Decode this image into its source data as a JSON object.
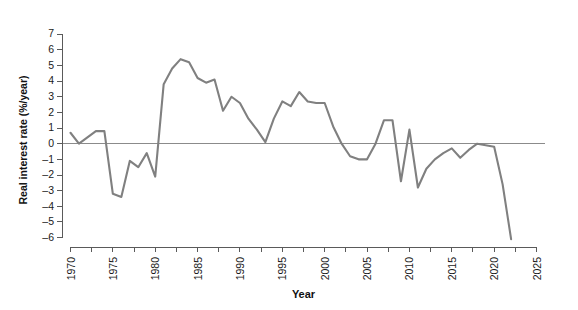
{
  "chart_data": {
    "type": "line",
    "title": "",
    "xlabel": "Year",
    "ylabel": "Real interest rate (%/year)",
    "xlim": [
      1969,
      2026
    ],
    "ylim": [
      -6.6,
      7.2
    ],
    "grid": false,
    "legend": null,
    "x_ticks": [
      1970,
      1975,
      1980,
      1985,
      1990,
      1995,
      2000,
      2005,
      2010,
      2015,
      2020,
      2025
    ],
    "x_minor_tick_step": 2.5,
    "y_ticks": [
      -6,
      -5,
      -4,
      -3,
      -2,
      -1,
      0,
      1,
      2,
      3,
      4,
      5,
      6,
      7
    ],
    "line_color": "#808080",
    "axis_color": "#5a5a5a",
    "zero_line_color": "#8b8b8b",
    "background": "#ffffff",
    "series": [
      {
        "name": "Real interest rate",
        "x": [
          1970,
          1971,
          1972,
          1973,
          1974,
          1975,
          1976,
          1977,
          1978,
          1979,
          1980,
          1981,
          1982,
          1983,
          1984,
          1985,
          1986,
          1987,
          1988,
          1989,
          1990,
          1991,
          1992,
          1993,
          1994,
          1995,
          1996,
          1997,
          1998,
          1999,
          2000,
          2001,
          2002,
          2003,
          2004,
          2005,
          2006,
          2007,
          2008,
          2009,
          2010,
          2011,
          2012,
          2013,
          2014,
          2015,
          2016,
          2017,
          2018,
          2019,
          2020,
          2021,
          2022
        ],
        "values": [
          0.7,
          0.0,
          0.4,
          0.8,
          0.8,
          -3.2,
          -3.4,
          -1.1,
          -1.5,
          -0.6,
          -2.1,
          3.8,
          4.8,
          5.4,
          5.2,
          4.2,
          3.9,
          4.1,
          2.1,
          3.0,
          2.6,
          1.6,
          0.9,
          0.1,
          1.6,
          2.7,
          2.4,
          3.3,
          2.7,
          2.6,
          2.6,
          1.1,
          0.0,
          -0.8,
          -1.0,
          -1.0,
          0.0,
          1.5,
          1.5,
          -2.4,
          0.9,
          -2.8,
          -1.6,
          -1.0,
          -0.6,
          -0.3,
          -0.9,
          -0.4,
          0.0,
          -0.1,
          -0.2,
          -2.6,
          -6.1
        ]
      }
    ]
  },
  "axis": {
    "x_title": "Year",
    "y_title": "Real interest rate (%/year)"
  }
}
